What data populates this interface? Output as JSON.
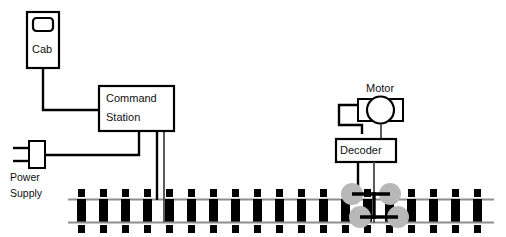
{
  "diagram": {
    "background_color": "#ffffff",
    "line_color": "#000000",
    "rail_color": "#8e8e8e",
    "wheel_color": "#b8b8b8"
  },
  "components": {
    "cab": {
      "label": "Cab",
      "name": "cab-throttle"
    },
    "command_station": {
      "label_line1": "Command",
      "label_line2": "Station",
      "name": "command-station"
    },
    "power_supply": {
      "label_line1": "Power",
      "label_line2": "Supply",
      "name": "power-supply"
    },
    "motor": {
      "label": "Motor",
      "name": "motor"
    },
    "decoder": {
      "label": "Decoder",
      "name": "decoder"
    },
    "track": {
      "name": "railroad-track",
      "tie_count": 19,
      "rail_count": 2
    },
    "wheels": {
      "name": "locomotive-wheels",
      "count": 4
    }
  },
  "connections": [
    {
      "from": "cab",
      "to": "command_station"
    },
    {
      "from": "power_supply",
      "to": "command_station"
    },
    {
      "from": "command_station",
      "to": "track"
    },
    {
      "from": "motor",
      "to": "decoder"
    },
    {
      "from": "decoder",
      "to": "wheels"
    }
  ]
}
